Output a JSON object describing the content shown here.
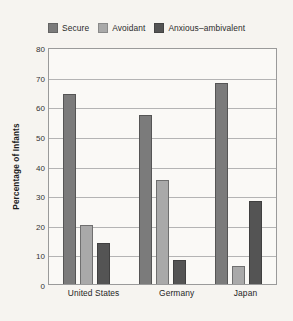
{
  "chart_data": {
    "type": "bar",
    "title": "",
    "subtitle": "",
    "xlabel": "",
    "ylabel": "Percentage of Infants",
    "categories": [
      "United States",
      "Germany",
      "Japan"
    ],
    "series": [
      {
        "name": "Secure",
        "color": "#7b7b7b",
        "values": [
          64,
          57,
          68
        ]
      },
      {
        "name": "Avoidant",
        "color": "#a9a9a9",
        "values": [
          20,
          35,
          6
        ]
      },
      {
        "name": "Anxious–ambivalent",
        "color": "#545454",
        "values": [
          14,
          8,
          28
        ]
      }
    ],
    "ylim": [
      0,
      80
    ],
    "ytick_step": 10,
    "yticks": [
      0,
      10,
      20,
      30,
      40,
      50,
      60,
      70,
      80
    ],
    "ytick_labels": [
      "0",
      "10",
      "20",
      "30",
      "40",
      "50",
      "60",
      "70",
      "80"
    ],
    "grid": true,
    "grid_axis": "y",
    "legend_position": "top",
    "background_color": "#f6f4f0",
    "plot_background_color": "#faf9f6",
    "frame_color": "#9a9a9a",
    "gridline_color": "#b4b4b4"
  }
}
